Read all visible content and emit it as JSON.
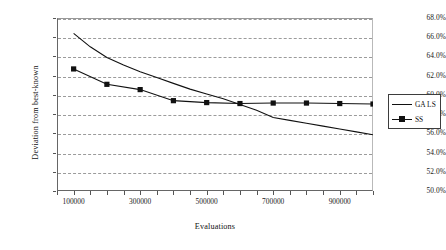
{
  "chart_data": {
    "type": "line",
    "title": "",
    "xlabel": "Evaluations",
    "ylabel": "Deviation from best-known",
    "xlim": [
      50000,
      1000000
    ],
    "ylim": [
      0.5,
      0.68
    ],
    "grid": true,
    "legend_position": "right",
    "y_ticks": [
      "50.0%",
      "52.0%",
      "54.0%",
      "56.0%",
      "58.0%",
      "60.0%",
      "62.0%",
      "64.0%",
      "66.0%",
      "68.0%"
    ],
    "y_tick_values": [
      0.5,
      0.52,
      0.54,
      0.56,
      0.58,
      0.6,
      0.62,
      0.64,
      0.66,
      0.68
    ],
    "x_ticks": [
      "100000",
      "300000",
      "500000",
      "700000",
      "900000"
    ],
    "x_tick_values": [
      100000,
      300000,
      500000,
      700000,
      900000
    ],
    "x_minor_tick_values": [
      50000,
      150000,
      200000,
      250000,
      350000,
      400000,
      450000,
      550000,
      600000,
      650000,
      750000,
      800000,
      850000,
      950000,
      1000000
    ],
    "series": [
      {
        "name": "GA LS",
        "marker": "none",
        "color": "#111111",
        "x": [
          100000,
          150000,
          200000,
          250000,
          300000,
          350000,
          400000,
          450000,
          500000,
          550000,
          600000,
          650000,
          700000,
          750000,
          800000,
          850000,
          900000,
          950000,
          1000000
        ],
        "values": [
          0.664,
          0.65,
          0.639,
          0.631,
          0.624,
          0.618,
          0.612,
          0.606,
          0.601,
          0.596,
          0.59,
          0.584,
          0.5765,
          0.5735,
          0.5705,
          0.5675,
          0.5645,
          0.5615,
          0.5585
        ]
      },
      {
        "name": "SS",
        "marker": "square",
        "color": "#111111",
        "x": [
          100000,
          200000,
          300000,
          400000,
          500000,
          600000,
          700000,
          800000,
          900000,
          1000000
        ],
        "values": [
          0.627,
          0.611,
          0.6055,
          0.594,
          0.592,
          0.591,
          0.5915,
          0.5915,
          0.591,
          0.5905
        ]
      }
    ]
  },
  "legend": {
    "entries": [
      {
        "label": "GA LS"
      },
      {
        "label": "SS"
      }
    ]
  }
}
